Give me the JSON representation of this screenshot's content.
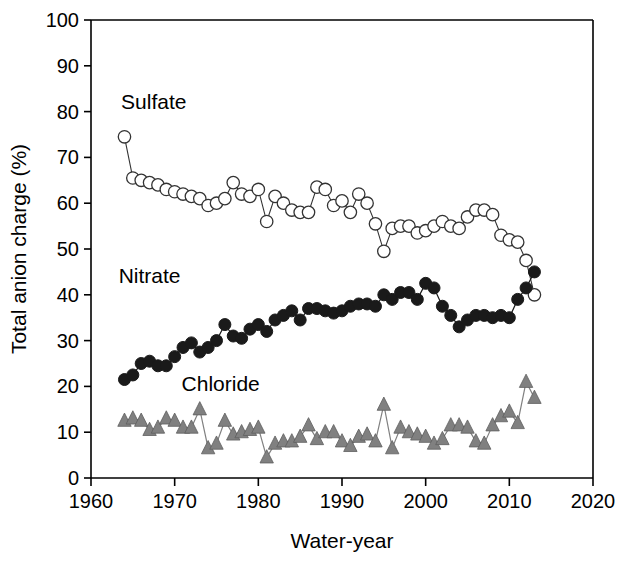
{
  "chart_data": {
    "type": "line",
    "title": "",
    "subtitle": "",
    "xlabel": "Water-year",
    "ylabel": "Total anion charge (%)",
    "xlim": [
      1960,
      2020
    ],
    "ylim": [
      0,
      100
    ],
    "xticks": [
      1960,
      1970,
      1980,
      1990,
      2000,
      2010,
      2020
    ],
    "yticks": [
      0,
      10,
      20,
      30,
      40,
      50,
      60,
      70,
      80,
      90,
      100
    ],
    "grid": false,
    "legend_position": "inline-annotations",
    "annotations": [
      {
        "text": "Sulfate",
        "x": 1967.5,
        "y": 80.5
      },
      {
        "text": "Nitrate",
        "x": 1967.0,
        "y": 42.5
      },
      {
        "text": "Chloride",
        "x": 1975.5,
        "y": 19.0
      }
    ],
    "x": [
      1964,
      1965,
      1966,
      1967,
      1968,
      1969,
      1970,
      1971,
      1972,
      1973,
      1974,
      1975,
      1976,
      1977,
      1978,
      1979,
      1980,
      1981,
      1982,
      1983,
      1984,
      1985,
      1986,
      1987,
      1988,
      1989,
      1990,
      1991,
      1992,
      1993,
      1994,
      1995,
      1996,
      1997,
      1998,
      1999,
      2000,
      2001,
      2002,
      2003,
      2004,
      2005,
      2006,
      2007,
      2008,
      2009,
      2010,
      2011,
      2012,
      2013
    ],
    "series": [
      {
        "name": "Sulfate",
        "marker": "open-circle",
        "color": "#000000",
        "fill": "#ffffff",
        "values": [
          74.5,
          65.5,
          65.0,
          64.5,
          64.0,
          63.0,
          62.5,
          62.0,
          61.5,
          61.0,
          59.5,
          60.0,
          61.0,
          64.5,
          62.0,
          61.5,
          63.0,
          56.0,
          61.5,
          60.0,
          58.5,
          58.0,
          58.0,
          63.5,
          63.0,
          59.5,
          60.5,
          58.0,
          62.0,
          60.0,
          55.5,
          49.5,
          54.5,
          55.0,
          55.0,
          53.5,
          54.0,
          55.0,
          56.0,
          55.0,
          54.5,
          57.0,
          58.5,
          58.5,
          57.5,
          53.0,
          52.0,
          51.5,
          47.5,
          40.0
        ]
      },
      {
        "name": "Nitrate",
        "marker": "filled-circle",
        "color": "#1a1a1a",
        "fill": "#1a1a1a",
        "values": [
          21.5,
          22.5,
          25.0,
          25.5,
          24.5,
          24.5,
          26.5,
          28.5,
          29.5,
          27.5,
          28.5,
          30.0,
          33.5,
          31.0,
          30.5,
          32.5,
          33.5,
          32.0,
          34.5,
          35.5,
          36.5,
          34.5,
          37.0,
          37.0,
          36.5,
          36.0,
          36.5,
          37.5,
          38.0,
          38.0,
          37.5,
          40.0,
          39.0,
          40.5,
          40.5,
          39.0,
          42.5,
          41.5,
          37.5,
          35.5,
          33.0,
          34.5,
          35.5,
          35.5,
          35.0,
          35.5,
          35.0,
          39.0,
          41.5,
          45.0
        ]
      },
      {
        "name": "Chloride",
        "marker": "filled-triangle",
        "color": "#808080",
        "fill": "#808080",
        "values": [
          12.5,
          13.0,
          12.5,
          10.5,
          11.0,
          13.0,
          12.5,
          11.0,
          11.0,
          15.0,
          6.5,
          7.5,
          12.5,
          9.5,
          10.0,
          10.5,
          11.0,
          4.5,
          7.5,
          8.0,
          8.0,
          9.0,
          11.5,
          8.5,
          10.0,
          10.0,
          8.0,
          7.0,
          9.0,
          9.5,
          8.0,
          16.0,
          6.5,
          11.0,
          10.0,
          9.5,
          9.0,
          7.5,
          8.5,
          11.5,
          11.5,
          11.0,
          8.0,
          7.5,
          11.5,
          13.5,
          14.5,
          12.0,
          21.0,
          17.5
        ]
      }
    ]
  },
  "axes": {
    "x_tick_labels": [
      "1960",
      "1970",
      "1980",
      "1990",
      "2000",
      "2010",
      "2020"
    ],
    "y_tick_labels": [
      "0",
      "10",
      "20",
      "30",
      "40",
      "50",
      "60",
      "70",
      "80",
      "90",
      "100"
    ],
    "x_axis_title": "Water-year",
    "y_axis_title": "Total anion charge (%)"
  },
  "series_labels": {
    "sulfate": "Sulfate",
    "nitrate": "Nitrate",
    "chloride": "Chloride"
  },
  "colors": {
    "axis": "#000000",
    "sulfate_stroke": "#333333",
    "nitrate_fill": "#1a1a1a",
    "chloride_fill": "#808080",
    "background": "#ffffff"
  }
}
